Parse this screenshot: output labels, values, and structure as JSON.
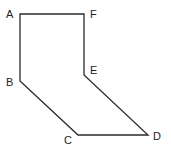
{
  "diagram": {
    "type": "polygon",
    "stroke_color": "#2b2b2b",
    "background": "#ffffff",
    "vertices": [
      {
        "label": "A",
        "x": 20,
        "y": 14,
        "label_x": 6,
        "label_y": 18
      },
      {
        "label": "B",
        "x": 20,
        "y": 81,
        "label_x": 6,
        "label_y": 86
      },
      {
        "label": "C",
        "x": 78,
        "y": 135,
        "label_x": 64,
        "label_y": 144
      },
      {
        "label": "D",
        "x": 148,
        "y": 135,
        "label_x": 153,
        "label_y": 140
      },
      {
        "label": "E",
        "x": 84,
        "y": 75,
        "label_x": 90,
        "label_y": 74
      },
      {
        "label": "F",
        "x": 84,
        "y": 14,
        "label_x": 90,
        "label_y": 18
      }
    ],
    "edges": [
      [
        "A",
        "B"
      ],
      [
        "B",
        "C"
      ],
      [
        "C",
        "D"
      ],
      [
        "D",
        "E"
      ],
      [
        "E",
        "F"
      ],
      [
        "F",
        "A"
      ]
    ]
  }
}
